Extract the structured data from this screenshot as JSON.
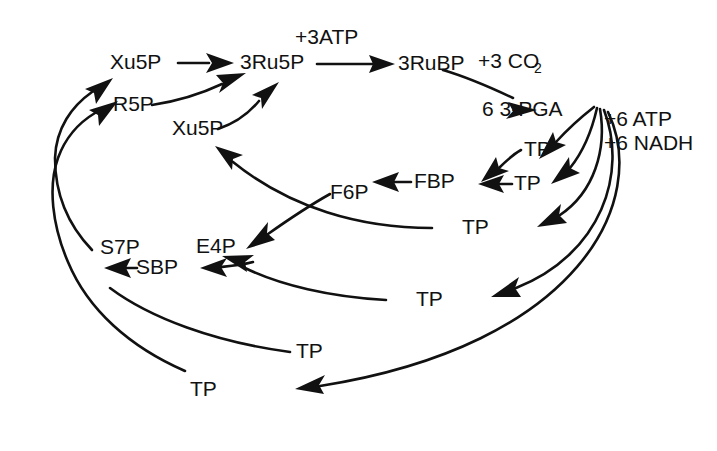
{
  "diagram": {
    "type": "metabolic-pathway",
    "background_color": "#ffffff",
    "line_color": "#111111",
    "metabolites": {
      "xu5p_top": "Xu5P",
      "r5p": "R5P",
      "xu5p_lower": "Xu5P",
      "ru5p": "3Ru5P",
      "rubp": "3RuBP",
      "pga": "6 3-PGA",
      "tp_1": "TP",
      "tp_2": "TP",
      "tp_3": "TP",
      "tp_4": "TP",
      "tp_5": "TP",
      "fbp": "FBP",
      "f6p": "F6P",
      "e4p": "E4P",
      "sbp": "SBP",
      "s7p": "S7P"
    },
    "cofactors": {
      "atp_3": "+3ATP",
      "co2": "+3 CO",
      "co2_subscript": "2",
      "atp_6": "+6 ATP",
      "nadh_6": "+6 NADH"
    }
  }
}
